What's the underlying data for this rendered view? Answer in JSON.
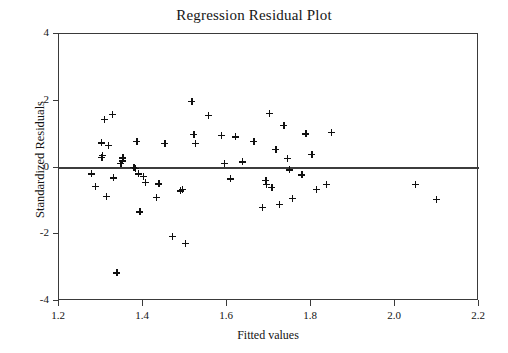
{
  "chart_data": {
    "type": "scatter",
    "title": "Regression Residual Plot",
    "xlabel": "Fitted values",
    "ylabel": "Standardized Residuals",
    "xlim": [
      1.2,
      2.2
    ],
    "ylim": [
      -4,
      4
    ],
    "xticks": [
      "1.2",
      "1.4",
      "1.6",
      "1.8",
      "2.0",
      "2.2"
    ],
    "xtick_values": [
      1.2,
      1.4,
      1.6,
      1.8,
      2.0,
      2.2
    ],
    "yticks": [
      "4",
      "2",
      "0",
      "-2",
      "-4"
    ],
    "ytick_values": [
      4,
      2,
      0,
      -2,
      -4
    ],
    "grid": false,
    "legend": null,
    "marker": "plus",
    "marker_color": "#101010",
    "reference_line": {
      "y": 0,
      "color": "#3c3c3c",
      "width": 2
    },
    "frame_color": "#3a3a3a",
    "background": "#ffffff",
    "n_points": 62,
    "points": [
      {
        "x": 1.277,
        "y": -0.19
      },
      {
        "x": 1.286,
        "y": -0.57
      },
      {
        "x": 1.3,
        "y": 0.74
      },
      {
        "x": 1.302,
        "y": 0.3
      },
      {
        "x": 1.303,
        "y": 0.36
      },
      {
        "x": 1.308,
        "y": 1.44
      },
      {
        "x": 1.312,
        "y": -0.87
      },
      {
        "x": 1.318,
        "y": 0.66
      },
      {
        "x": 1.327,
        "y": 1.6
      },
      {
        "x": 1.33,
        "y": -0.31
      },
      {
        "x": 1.338,
        "y": -3.15
      },
      {
        "x": 1.347,
        "y": 0.12
      },
      {
        "x": 1.35,
        "y": 0.2
      },
      {
        "x": 1.352,
        "y": 0.29
      },
      {
        "x": 1.378,
        "y": 0.01
      },
      {
        "x": 1.381,
        "y": -0.03
      },
      {
        "x": 1.385,
        "y": 0.78
      },
      {
        "x": 1.389,
        "y": -0.19
      },
      {
        "x": 1.392,
        "y": -1.33
      },
      {
        "x": 1.4,
        "y": -0.27
      },
      {
        "x": 1.406,
        "y": -0.44
      },
      {
        "x": 1.432,
        "y": -0.9
      },
      {
        "x": 1.438,
        "y": -0.49
      },
      {
        "x": 1.452,
        "y": 0.73
      },
      {
        "x": 1.47,
        "y": -2.06
      },
      {
        "x": 1.489,
        "y": -0.7
      },
      {
        "x": 1.494,
        "y": -0.65
      },
      {
        "x": 1.5,
        "y": -2.28
      },
      {
        "x": 1.516,
        "y": 1.99
      },
      {
        "x": 1.521,
        "y": 1.0
      },
      {
        "x": 1.524,
        "y": 0.73
      },
      {
        "x": 1.555,
        "y": 1.57
      },
      {
        "x": 1.586,
        "y": 0.97
      },
      {
        "x": 1.594,
        "y": 0.12
      },
      {
        "x": 1.608,
        "y": -0.34
      },
      {
        "x": 1.62,
        "y": 0.92
      },
      {
        "x": 1.636,
        "y": 0.17
      },
      {
        "x": 1.664,
        "y": 0.78
      },
      {
        "x": 1.684,
        "y": -1.2
      },
      {
        "x": 1.692,
        "y": -0.38
      },
      {
        "x": 1.694,
        "y": -0.51
      },
      {
        "x": 1.7,
        "y": 1.62
      },
      {
        "x": 1.707,
        "y": -0.6
      },
      {
        "x": 1.716,
        "y": 0.55
      },
      {
        "x": 1.724,
        "y": -1.1
      },
      {
        "x": 1.735,
        "y": 1.26
      },
      {
        "x": 1.743,
        "y": 0.27
      },
      {
        "x": 1.748,
        "y": -0.07
      },
      {
        "x": 1.756,
        "y": -0.93
      },
      {
        "x": 1.778,
        "y": -0.22
      },
      {
        "x": 1.788,
        "y": 1.01
      },
      {
        "x": 1.802,
        "y": 0.4
      },
      {
        "x": 1.812,
        "y": -0.65
      },
      {
        "x": 1.836,
        "y": -0.5
      },
      {
        "x": 1.848,
        "y": 1.05
      },
      {
        "x": 2.048,
        "y": -0.5
      },
      {
        "x": 2.098,
        "y": -0.95
      }
    ]
  }
}
